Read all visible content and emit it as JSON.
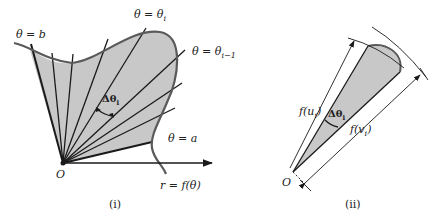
{
  "figure_i": {
    "caption": "(i)",
    "labels": {
      "theta_b": "θ = b",
      "theta_i": "θ = θ",
      "theta_i_sub": "i",
      "theta_i1": "θ = θ",
      "theta_i1_sub": "i−1",
      "delta_theta": "Δθ",
      "delta_theta_sub": "i",
      "theta_a": "θ = a",
      "origin": "O",
      "curve": "r = f(θ)"
    }
  },
  "figure_ii": {
    "caption": "(ii)",
    "labels": {
      "f_ui": "f(u",
      "f_ui_sub": "i",
      "f_ui_close": ")",
      "f_vi": "f(v",
      "f_vi_sub": "i",
      "f_vi_close": ")",
      "delta_theta": "Δθ",
      "delta_theta_sub": "i",
      "origin": "O"
    }
  },
  "colors": {
    "fill": "#c8c8c8",
    "curve": "#5a5a5a",
    "line": "#1a1a1a"
  }
}
